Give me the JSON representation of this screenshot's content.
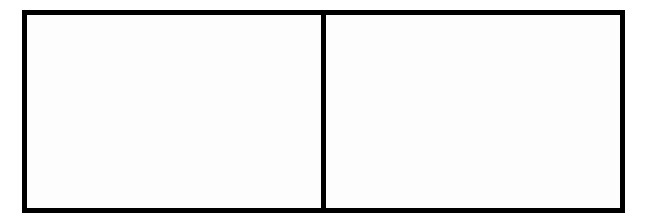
{
  "layout": {
    "panels": [
      {
        "id": "left",
        "content": ""
      },
      {
        "id": "right",
        "content": ""
      }
    ],
    "border_color": "#000000",
    "background_color": "#ffffff"
  }
}
